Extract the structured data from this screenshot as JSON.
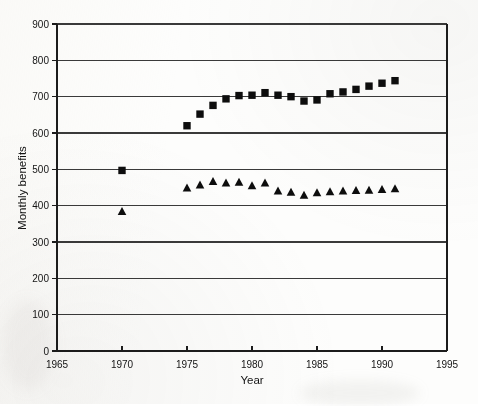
{
  "chart_data": {
    "type": "scatter",
    "title": "",
    "xlabel": "Year",
    "ylabel": "Monthly benefits",
    "xlim": [
      1965,
      1995
    ],
    "ylim": [
      0,
      900
    ],
    "xticks": [
      1965,
      1970,
      1975,
      1980,
      1985,
      1990,
      1995
    ],
    "yticks": [
      0,
      100,
      200,
      300,
      400,
      500,
      600,
      700,
      800,
      900
    ],
    "grid": "horizontal",
    "legend": "none",
    "series": [
      {
        "name": "squares",
        "marker": "square",
        "color": "#0d0d0d",
        "points": [
          {
            "x": 1970,
            "y": 497
          },
          {
            "x": 1975,
            "y": 620
          },
          {
            "x": 1976,
            "y": 652
          },
          {
            "x": 1977,
            "y": 676
          },
          {
            "x": 1978,
            "y": 694
          },
          {
            "x": 1979,
            "y": 703
          },
          {
            "x": 1980,
            "y": 704
          },
          {
            "x": 1981,
            "y": 711
          },
          {
            "x": 1982,
            "y": 704
          },
          {
            "x": 1983,
            "y": 700
          },
          {
            "x": 1984,
            "y": 688
          },
          {
            "x": 1985,
            "y": 691
          },
          {
            "x": 1986,
            "y": 708
          },
          {
            "x": 1987,
            "y": 713
          },
          {
            "x": 1988,
            "y": 720
          },
          {
            "x": 1989,
            "y": 729
          },
          {
            "x": 1990,
            "y": 737
          },
          {
            "x": 1991,
            "y": 744
          }
        ]
      },
      {
        "name": "triangles",
        "marker": "triangle",
        "color": "#0d0d0d",
        "points": [
          {
            "x": 1970,
            "y": 385
          },
          {
            "x": 1975,
            "y": 450
          },
          {
            "x": 1976,
            "y": 458
          },
          {
            "x": 1977,
            "y": 468
          },
          {
            "x": 1978,
            "y": 464
          },
          {
            "x": 1979,
            "y": 466
          },
          {
            "x": 1980,
            "y": 456
          },
          {
            "x": 1981,
            "y": 464
          },
          {
            "x": 1982,
            "y": 442
          },
          {
            "x": 1983,
            "y": 438
          },
          {
            "x": 1984,
            "y": 430
          },
          {
            "x": 1985,
            "y": 437
          },
          {
            "x": 1986,
            "y": 440
          },
          {
            "x": 1987,
            "y": 442
          },
          {
            "x": 1988,
            "y": 443
          },
          {
            "x": 1989,
            "y": 444
          },
          {
            "x": 1990,
            "y": 446
          },
          {
            "x": 1991,
            "y": 448
          }
        ]
      }
    ]
  }
}
